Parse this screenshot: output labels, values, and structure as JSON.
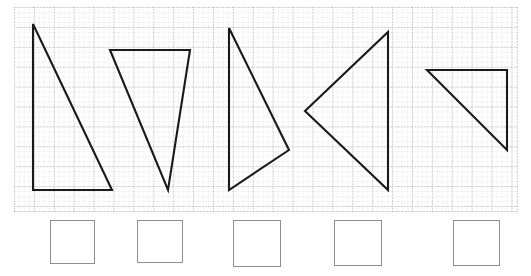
{
  "page": {
    "width": 531,
    "height": 276,
    "background_color": "#ffffff"
  },
  "grid": {
    "name": "dotted-graph-grid",
    "x": 14,
    "y": 7,
    "width": 504,
    "height": 205,
    "major_cell_px": 19.9,
    "minor_cell_px": 4.975,
    "major_line_color": "#9a9a9a",
    "minor_line_color": "#c9c9c9",
    "line_style": "dotted",
    "columns_major": 25,
    "rows_major": 10
  },
  "shapes": {
    "stroke_color": "#1a1a1a",
    "stroke_width": 2.1,
    "fill": "none",
    "items": [
      {
        "name": "triangle-1",
        "label": "Triangle 1",
        "description": "Right triangle, vertical leg on left, horizontal leg on bottom, right angle bottom-left",
        "points": "33,24 33,190 112,190",
        "vertices": [
          [
            33,
            24
          ],
          [
            33,
            190
          ],
          [
            112,
            190
          ]
        ]
      },
      {
        "name": "triangle-2",
        "label": "Triangle 2",
        "description": "Downward pointing triangle, horizontal top edge, apex at bottom",
        "points": "110,50 190,50 168,190",
        "vertices": [
          [
            110,
            50
          ],
          [
            190,
            50
          ],
          [
            168,
            190
          ]
        ]
      },
      {
        "name": "triangle-3",
        "label": "Triangle 3",
        "description": "Triangle with vertical left edge and vertex pointing right",
        "points": "229,28 289,150 229,190",
        "vertices": [
          [
            229,
            28
          ],
          [
            289,
            150
          ],
          [
            229,
            190
          ]
        ]
      },
      {
        "name": "triangle-4",
        "label": "Triangle 4",
        "description": "Triangle with vertical right edge and vertex pointing left",
        "points": "388,32 388,190 305,111",
        "vertices": [
          [
            388,
            32
          ],
          [
            388,
            190
          ],
          [
            305,
            111
          ]
        ]
      },
      {
        "name": "triangle-5",
        "label": "Triangle 5",
        "description": "Right triangle, horizontal top edge, vertical right edge, right angle top-right",
        "points": "427,70 507,70 507,150",
        "vertices": [
          [
            427,
            70
          ],
          [
            507,
            70
          ],
          [
            507,
            150
          ]
        ]
      }
    ]
  },
  "answer_boxes": {
    "name": "answer-boxes-row",
    "count": 5,
    "border_color": "#8d8d93",
    "fill_color": "#ffffff",
    "items": [
      {
        "name": "answer-box-1",
        "label": "",
        "x": 50,
        "width": 45,
        "height": 44
      },
      {
        "name": "answer-box-2",
        "label": "",
        "x": 137,
        "width": 46,
        "height": 43
      },
      {
        "name": "answer-box-3",
        "label": "",
        "x": 233,
        "width": 48,
        "height": 47
      },
      {
        "name": "answer-box-4",
        "label": "",
        "x": 334,
        "width": 48,
        "height": 46
      },
      {
        "name": "answer-box-5",
        "label": "",
        "x": 453,
        "width": 47,
        "height": 46
      }
    ]
  }
}
